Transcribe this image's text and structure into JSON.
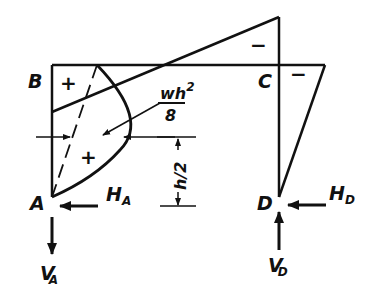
{
  "diagram": {
    "type": "bending-moment-diagram",
    "nodes": {
      "A": {
        "label": "A"
      },
      "B": {
        "label": "B"
      },
      "C": {
        "label": "C"
      },
      "D": {
        "label": "D"
      }
    },
    "reactions": {
      "HA": {
        "main": "H",
        "sub": "A"
      },
      "VA": {
        "main": "V",
        "sub": "A"
      },
      "HD": {
        "main": "H",
        "sub": "D"
      },
      "VD": {
        "main": "V",
        "sub": "D"
      }
    },
    "signs": {
      "region_B": "+",
      "region_parabola": "+",
      "region_top_C": "−",
      "region_right_C": "−"
    },
    "annotations": {
      "moment_label_num": "wh",
      "moment_label_exp": "2",
      "moment_label_den": "8",
      "dimension_label": "h/2"
    },
    "colors": {
      "ink": "#111111",
      "background": "#ffffff"
    }
  }
}
